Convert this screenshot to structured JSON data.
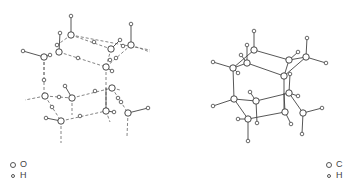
{
  "figure": {
    "panels": [
      {
        "id": "ice",
        "description": "Hydrogen-bonded water (ice) lattice",
        "legend": [
          {
            "symbol": "large-circle",
            "label": "O"
          },
          {
            "symbol": "small-circle",
            "label": "H"
          }
        ],
        "heavy_atoms": [
          [
            71,
            35
          ],
          [
            59,
            52
          ],
          [
            44,
            57
          ],
          [
            111,
            49
          ],
          [
            131,
            45
          ],
          [
            106,
            67
          ],
          [
            45,
            96
          ],
          [
            72,
            98
          ],
          [
            112,
            88
          ],
          [
            61,
            121
          ],
          [
            106,
            111
          ],
          [
            128,
            113
          ]
        ],
        "light_atoms": [
          [
            71,
            16
          ],
          [
            60,
            33
          ],
          [
            57,
            45
          ],
          [
            50,
            55
          ],
          [
            78,
            58
          ],
          [
            94,
            42
          ],
          [
            120,
            40
          ],
          [
            123,
            46
          ],
          [
            131,
            24
          ],
          [
            23,
            51
          ],
          [
            44,
            80
          ],
          [
            65,
            86
          ],
          [
            59,
            97
          ],
          [
            52,
            107
          ],
          [
            95,
            91
          ],
          [
            116,
            58
          ],
          [
            112,
            71
          ],
          [
            110,
            60
          ],
          [
            46,
            118
          ],
          [
            80,
            116
          ],
          [
            118,
            98
          ],
          [
            114,
            112
          ],
          [
            121,
            102
          ],
          [
            148,
            108
          ]
        ],
        "covalent_bonds": [
          [
            [
              71,
              35
            ],
            [
              71,
              16
            ]
          ],
          [
            [
              59,
              52
            ],
            [
              60,
              33
            ]
          ],
          [
            [
              44,
              57
            ],
            [
              23,
              51
            ]
          ],
          [
            [
              131,
              45
            ],
            [
              131,
              24
            ]
          ],
          [
            [
              111,
              49
            ],
            [
              120,
              40
            ]
          ],
          [
            [
              72,
              98
            ],
            [
              65,
              86
            ]
          ],
          [
            [
              61,
              121
            ],
            [
              46,
              118
            ]
          ],
          [
            [
              128,
              113
            ],
            [
              148,
              108
            ]
          ],
          [
            [
              106,
              111
            ],
            [
              106,
              88
            ]
          ],
          [
            [
              106,
              67
            ],
            [
              112,
              71
            ]
          ],
          [
            [
              44,
              57
            ],
            [
              50,
              55
            ]
          ],
          [
            [
              106,
              111
            ],
            [
              114,
              112
            ]
          ]
        ],
        "hydrogen_bonds": [
          [
            [
              71,
              35
            ],
            [
              57,
              45
            ]
          ],
          [
            [
              71,
              35
            ],
            [
              111,
              49
            ]
          ],
          [
            [
              71,
              35
            ],
            [
              150,
              50
            ]
          ],
          [
            [
              59,
              52
            ],
            [
              106,
              67
            ]
          ],
          [
            [
              44,
              57
            ],
            [
              44,
              96
            ]
          ],
          [
            [
              44,
              57
            ],
            [
              44,
              75
            ]
          ],
          [
            [
              131,
              45
            ],
            [
              150,
              52
            ]
          ],
          [
            [
              131,
              45
            ],
            [
              106,
              67
            ]
          ],
          [
            [
              106,
              67
            ],
            [
              106,
              111
            ]
          ],
          [
            [
              45,
              96
            ],
            [
              25,
              100
            ]
          ],
          [
            [
              45,
              96
            ],
            [
              72,
              98
            ]
          ],
          [
            [
              72,
              98
            ],
            [
              112,
              88
            ]
          ],
          [
            [
              72,
              98
            ],
            [
              72,
              115
            ]
          ],
          [
            [
              112,
              88
            ],
            [
              120,
              90
            ]
          ],
          [
            [
              45,
              96
            ],
            [
              61,
              121
            ]
          ],
          [
            [
              61,
              121
            ],
            [
              106,
              111
            ]
          ],
          [
            [
              61,
              121
            ],
            [
              61,
              143
            ]
          ],
          [
            [
              106,
              111
            ],
            [
              110,
              122
            ]
          ],
          [
            [
              128,
              113
            ],
            [
              127,
              136
            ]
          ],
          [
            [
              112,
              88
            ],
            [
              128,
              113
            ]
          ],
          [
            [
              111,
              49
            ],
            [
              106,
              67
            ]
          ]
        ]
      },
      {
        "id": "adamantane",
        "description": "Carbon framework with hydrogens",
        "legend": [
          {
            "symbol": "large-circle",
            "label": "C"
          },
          {
            "symbol": "small-circle",
            "label": "H"
          }
        ],
        "heavy_atoms": [
          [
            254,
            50
          ],
          [
            247,
            63
          ],
          [
            233,
            68
          ],
          [
            289,
            60
          ],
          [
            306,
            57
          ],
          [
            284,
            76
          ],
          [
            234,
            99
          ],
          [
            256,
            101
          ],
          [
            289,
            93
          ],
          [
            248,
            119
          ],
          [
            285,
            112
          ],
          [
            303,
            113
          ]
        ],
        "light_atoms": [
          [
            254,
            31
          ],
          [
            247,
            45
          ],
          [
            241,
            55
          ],
          [
            238,
            73
          ],
          [
            213,
            62
          ],
          [
            298,
            52
          ],
          [
            307,
            38
          ],
          [
            326,
            63
          ],
          [
            290,
            74
          ],
          [
            213,
            106
          ],
          [
            250,
            92
          ],
          [
            257,
            123
          ],
          [
            238,
            119
          ],
          [
            248,
            141
          ],
          [
            298,
            96
          ],
          [
            291,
            124
          ],
          [
            322,
            108
          ],
          [
            302,
            134
          ]
        ],
        "covalent_bonds": [
          [
            [
              254,
              50
            ],
            [
              289,
              60
            ]
          ],
          [
            [
              254,
              50
            ],
            [
              233,
              68
            ]
          ],
          [
            [
              254,
              50
            ],
            [
              254,
              31
            ]
          ],
          [
            [
              247,
              63
            ],
            [
              284,
              76
            ]
          ],
          [
            [
              247,
              63
            ],
            [
              233,
              68
            ]
          ],
          [
            [
              247,
              63
            ],
            [
              247,
              45
            ]
          ],
          [
            [
              247,
              63
            ],
            [
              241,
              55
            ]
          ],
          [
            [
              233,
              68
            ],
            [
              213,
              62
            ]
          ],
          [
            [
              233,
              68
            ],
            [
              238,
              73
            ]
          ],
          [
            [
              233,
              68
            ],
            [
              234,
              99
            ]
          ],
          [
            [
              289,
              60
            ],
            [
              306,
              57
            ]
          ],
          [
            [
              289,
              60
            ],
            [
              298,
              52
            ]
          ],
          [
            [
              289,
              60
            ],
            [
              284,
              76
            ]
          ],
          [
            [
              306,
              57
            ],
            [
              307,
              38
            ]
          ],
          [
            [
              306,
              57
            ],
            [
              326,
              63
            ]
          ],
          [
            [
              306,
              57
            ],
            [
              284,
              76
            ]
          ],
          [
            [
              284,
              76
            ],
            [
              284,
              112
            ]
          ],
          [
            [
              290,
              74
            ],
            [
              289,
              93
            ]
          ],
          [
            [
              234,
              99
            ],
            [
              256,
              101
            ]
          ],
          [
            [
              234,
              99
            ],
            [
              213,
              106
            ]
          ],
          [
            [
              234,
              99
            ],
            [
              248,
              119
            ]
          ],
          [
            [
              256,
              101
            ],
            [
              250,
              92
            ]
          ],
          [
            [
              256,
              101
            ],
            [
              257,
              123
            ]
          ],
          [
            [
              256,
              101
            ],
            [
              289,
              93
            ]
          ],
          [
            [
              289,
              93
            ],
            [
              298,
              96
            ]
          ],
          [
            [
              289,
              93
            ],
            [
              303,
              113
            ]
          ],
          [
            [
              248,
              119
            ],
            [
              285,
              112
            ]
          ],
          [
            [
              248,
              119
            ],
            [
              238,
              119
            ]
          ],
          [
            [
              248,
              119
            ],
            [
              248,
              141
            ]
          ],
          [
            [
              285,
              112
            ],
            [
              291,
              124
            ]
          ],
          [
            [
              285,
              112
            ],
            [
              284,
              93
            ]
          ],
          [
            [
              303,
              113
            ],
            [
              322,
              108
            ]
          ],
          [
            [
              303,
              113
            ],
            [
              302,
              134
            ]
          ]
        ]
      }
    ]
  }
}
